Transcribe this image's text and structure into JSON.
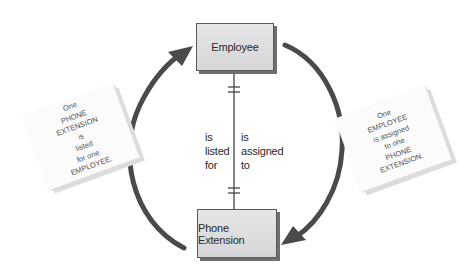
{
  "diagram": {
    "type": "entity-relationship",
    "entities": [
      {
        "id": "employee",
        "label": "Employee"
      },
      {
        "id": "phone_extension",
        "label": "Phone Extension"
      }
    ],
    "relationship": {
      "cardinality": "one-to-one",
      "left_label": "is\nlisted\nfor",
      "right_label": "is\nassigned\nto"
    },
    "notes": {
      "left": "One\nPHONE\nEXTENSION\nis\nlisted\nfor one\nEMPLOYEE.",
      "right": "One\nEMPLOYEE\nis assigned\nto one\nPHONE\nEXTENSION."
    },
    "colors": {
      "arrow": "#4a4a4a",
      "entity_fill": "#dcdcde",
      "line": "#444444"
    }
  }
}
